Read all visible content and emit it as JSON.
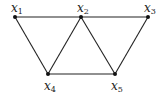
{
  "graph": {
    "nodes": [
      {
        "id": "x1",
        "name": "x",
        "sub": "1",
        "x": 15,
        "y": 17,
        "label_pos": "above"
      },
      {
        "id": "x2",
        "name": "x",
        "sub": "2",
        "x": 81,
        "y": 17,
        "label_pos": "above"
      },
      {
        "id": "x3",
        "name": "x",
        "sub": "3",
        "x": 148,
        "y": 17,
        "label_pos": "above"
      },
      {
        "id": "x4",
        "name": "x",
        "sub": "4",
        "x": 48,
        "y": 74,
        "label_pos": "below"
      },
      {
        "id": "x5",
        "name": "x",
        "sub": "5",
        "x": 115,
        "y": 74,
        "label_pos": "below"
      }
    ],
    "edges": [
      [
        "x1",
        "x2"
      ],
      [
        "x2",
        "x3"
      ],
      [
        "x1",
        "x4"
      ],
      [
        "x2",
        "x4"
      ],
      [
        "x2",
        "x5"
      ],
      [
        "x3",
        "x5"
      ],
      [
        "x4",
        "x5"
      ]
    ],
    "colors": {
      "edge": "#222222",
      "node": "#111111",
      "label": "#222222"
    }
  }
}
